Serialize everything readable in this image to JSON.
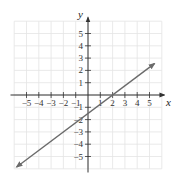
{
  "chart_data": {
    "type": "line",
    "title": "",
    "xlabel": "x",
    "ylabel": "y",
    "xlim": [
      -6,
      6
    ],
    "ylim": [
      -6,
      6
    ],
    "grid": true,
    "x_ticks": [
      -5,
      -4,
      -3,
      -2,
      -1,
      1,
      2,
      3,
      4,
      5
    ],
    "y_ticks": [
      -5,
      -4,
      -3,
      -2,
      -1,
      1,
      2,
      3,
      4,
      5
    ],
    "x_tick_labels": [
      "−5",
      "−4",
      "−3",
      "−2",
      "−1",
      "1",
      "2",
      "3",
      "4",
      "5"
    ],
    "y_tick_labels": [
      "−5",
      "−4",
      "−3",
      "−2",
      "−1",
      "1",
      "2",
      "3",
      "4",
      "5"
    ],
    "series": [
      {
        "name": "line",
        "equation": "y = 0.75x - 1.5",
        "x": [
          -5.8,
          5.4
        ],
        "y": [
          -5.85,
          2.55
        ],
        "arrows_both_ends": true,
        "color": "#6b6b6b"
      }
    ],
    "x_intercept": 2,
    "y_intercept": -1.5
  },
  "colors": {
    "grid": "#e4e4e4",
    "axis": "#333333",
    "line": "#6b6b6b"
  }
}
